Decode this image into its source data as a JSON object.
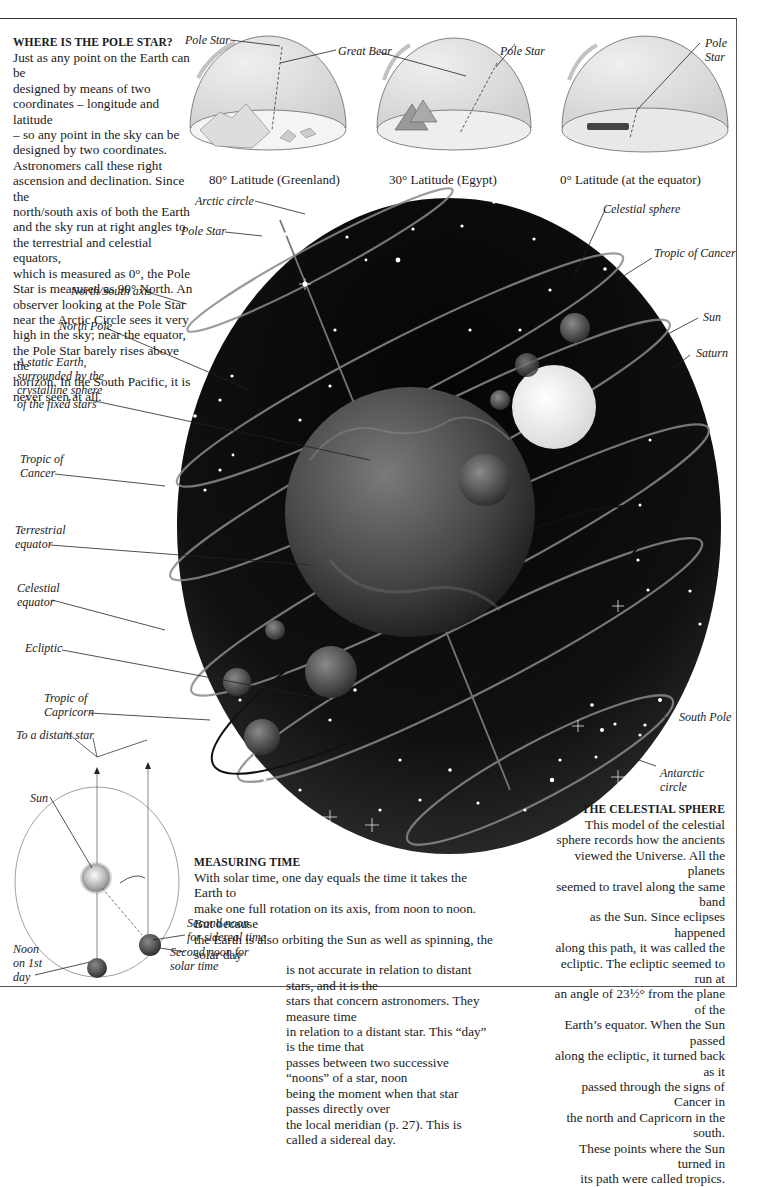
{
  "pole_star_section": {
    "heading": "WHERE IS THE POLE STAR?",
    "lines": [
      "Just as any point on the Earth can be",
      "designed by means of two",
      "coordinates – longitude and latitude",
      "– so any point in the sky can be",
      "designed by two coordinates.",
      "Astronomers call these right",
      "ascension and declination. Since the",
      "north/south axis of both the Earth",
      "and the sky run at right angles to",
      "the terrestrial and celestial equators,",
      "which is measured as 0°, the Pole",
      "Star is measured as 90° North. An",
      "observer looking at the Pole Star",
      "near the Arctic Circle sees it very",
      "high in the sky;  near the equator,",
      "the Pole Star barely rises above the",
      "horizon. In the South Pacific, it is",
      "never seen at all."
    ]
  },
  "domes": [
    {
      "caption": "80° Latitude (Greenland)",
      "labels": [
        "Pole Star",
        "Great Bear"
      ]
    },
    {
      "caption": "30° Latitude (Egypt)",
      "labels": [
        "Pole Star"
      ]
    },
    {
      "caption": "0° Latitude (at the equator)",
      "labels": [
        "Pole",
        "Star"
      ]
    }
  ],
  "sphere_labels_left": {
    "arctic_circle": "Arctic circle",
    "pole_star": "Pole Star",
    "north_south_axis": "North/South axis",
    "north_pole": "North Pole",
    "static_earth": [
      "A static Earth,",
      "surrounded by the",
      "crystalline sphere",
      "of the fixed stars"
    ],
    "tropic_cancer": [
      "Tropic of",
      "Cancer"
    ],
    "terrestrial_equator": [
      "Terrestrial",
      "equator"
    ],
    "celestial_equator": [
      "Celestial",
      "equator"
    ],
    "ecliptic": "Ecliptic",
    "tropic_capricorn": [
      "Tropic of",
      "Capricorn"
    ]
  },
  "sphere_labels_right": {
    "celestial_sphere": "Celestial sphere",
    "tropic_cancer": "Tropic of Cancer",
    "sun": "Sun",
    "saturn": "Saturn",
    "south_pole": "South Pole",
    "antarctic_circle": [
      "Antarctic",
      "circle"
    ]
  },
  "timing_diagram": {
    "distant_star": "To a distant star",
    "sun": "Sun",
    "noon_first_day": [
      "Noon",
      "on 1st",
      "day"
    ],
    "second_noon_sidereal": [
      "Second noon",
      "for sidereal time"
    ],
    "second_noon_solar": [
      "Second noon for",
      "solar time"
    ]
  },
  "measuring_time": {
    "heading": "MEASURING TIME",
    "lines_full": [
      "With solar time, one day equals the time it takes the Earth to",
      "make one full rotation on its axis, from noon to noon. But because",
      "the Earth is also orbiting the Sun as well as spinning, the solar day"
    ],
    "lines_indented": [
      "is not accurate in relation to distant stars, and it is the",
      "stars that concern astronomers. They measure time",
      "in relation to a distant star. This “day” is the time that",
      "passes between two successive “noons” of a star, noon",
      "being the moment when that star passes directly over",
      "the local meridian (p. 27). This is called a sidereal day."
    ]
  },
  "celestial_sphere_section": {
    "heading": "THE CELESTIAL SPHERE",
    "lines": [
      "This model of the celestial",
      "sphere records how the ancients",
      "viewed the Universe. All the planets",
      "seemed to travel along the same band",
      "as the Sun. Since eclipses happened",
      "along this path, it was called the",
      "ecliptic. The ecliptic seemed to run at",
      "an angle of 23½° from the plane of the",
      "Earth’s equator. When the Sun passed",
      "along the ecliptic, it turned back as it",
      "passed through the signs of Cancer in",
      "the north and Capricorn in the south.",
      "These points where the Sun turned in",
      "its path were called tropics."
    ]
  },
  "colors": {
    "sky": "#0a0a0a",
    "earth": "#4a4a4a",
    "sun": "#f0f0f0",
    "dome_fill": "#e4e4e4"
  }
}
